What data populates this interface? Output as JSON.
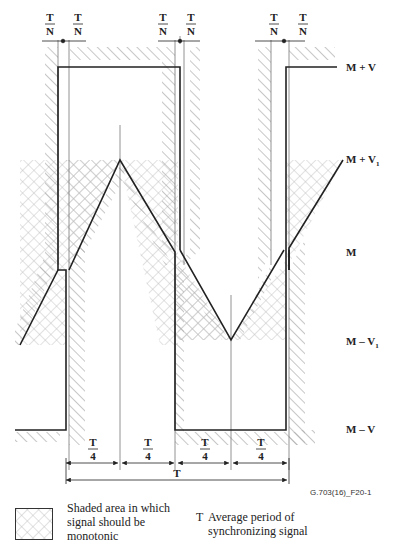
{
  "figure": {
    "id_label": "G.703(16)_F20-1",
    "levels": {
      "top": "M + V",
      "upper_mid": "M + V1",
      "upper_mid_base": "M + V",
      "upper_mid_sub": "1",
      "mid": "M",
      "lower_mid_base": "M – V",
      "lower_mid_sub": "1",
      "bottom": "M – V"
    },
    "tolerance_fraction": {
      "numerator": "T",
      "denominator": "N"
    },
    "quarter_fraction": {
      "numerator": "T",
      "denominator": "4"
    },
    "period_label": "T",
    "colors": {
      "signal": "#222222",
      "hatch": "#a8a8a8",
      "crosshatch": "#b8b8b8",
      "guide": "#777777"
    }
  },
  "legend": {
    "shaded_area": "Shaded area in which signal should be monotonic",
    "shaded_line1": "Shaded area in which",
    "shaded_line2": "signal should be",
    "shaded_line3": "monotonic",
    "t_symbol": "T",
    "t_line1": "Average period of",
    "t_line2": "synchronizing signal"
  }
}
